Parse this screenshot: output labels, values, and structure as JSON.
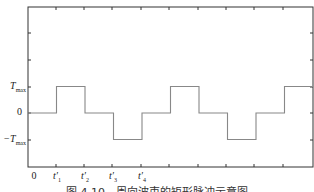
{
  "chart_data": {
    "type": "line",
    "title": "",
    "caption": "图 4.10　周向波束的矩形脉冲示意图",
    "xlabel": "",
    "ylabel": "",
    "x_tick_labels": [
      "0",
      "t'1",
      "t'2",
      "t'3",
      "t'4"
    ],
    "y_tick_labels": [
      "Tmax",
      "0",
      "-Tmax"
    ],
    "series": [
      {
        "name": "rectangular pulse",
        "step_x": [
          0,
          1,
          2,
          3,
          4,
          5,
          6,
          7,
          8,
          9,
          10
        ],
        "step_levels": [
          0,
          1,
          0,
          -1,
          0,
          1,
          0,
          -1,
          0,
          1
        ],
        "level_units": "Tmax"
      }
    ],
    "grid": false,
    "legend": null,
    "color": "#888888"
  },
  "labels": {
    "y_tmax": "T",
    "y_tmax_sub": "max",
    "y_zero": "0",
    "y_neg_tmax": "−T",
    "y_neg_tmax_sub": "max",
    "x_zero": "0",
    "x_t1": "t′",
    "x_t1_sub": "1",
    "x_t2": "t′",
    "x_t2_sub": "2",
    "x_t3": "t′",
    "x_t3_sub": "3",
    "x_t4": "t′",
    "x_t4_sub": "4"
  },
  "caption": "图 4.10　周向波束的矩形脉冲示意图"
}
